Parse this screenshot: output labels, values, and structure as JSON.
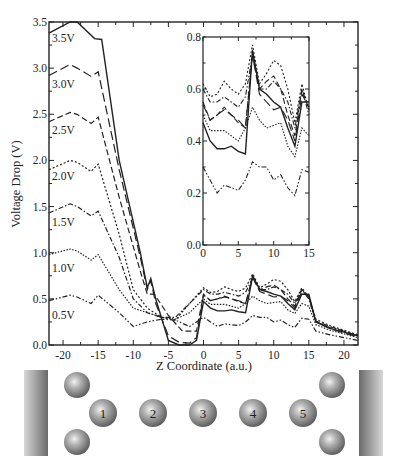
{
  "chart_data": {
    "type": "line",
    "title": "",
    "xlabel": "Z Coordinate (a.u.)",
    "ylabel": "Voltage Drop (V)",
    "xlim": [
      -22,
      22
    ],
    "ylim": [
      0,
      3.5
    ],
    "xticks": [
      -20,
      -15,
      -10,
      -5,
      0,
      5,
      10,
      15,
      20
    ],
    "yticks": [
      "0.0",
      "0.5",
      "1.0",
      "1.5",
      "2.0",
      "2.5",
      "3.0",
      "3.5"
    ],
    "grid": false,
    "legend": "inline labels at left edge",
    "series": [
      {
        "name": "3.5V",
        "style": "solid",
        "x": [
          -22,
          -19,
          -18,
          -15.5,
          -14.5,
          -12,
          -9,
          -8,
          -7.5,
          -6.8,
          -5,
          -3.5,
          -2,
          -1,
          0,
          1,
          2,
          3,
          4,
          5,
          6,
          7,
          8,
          9,
          10,
          11,
          12,
          13,
          14,
          15,
          16,
          18,
          20,
          22
        ],
        "y": [
          3.38,
          3.52,
          3.5,
          3.32,
          3.31,
          2.0,
          1.0,
          0.62,
          0.72,
          0.5,
          0.05,
          0.0,
          0.0,
          0.05,
          0.47,
          0.4,
          0.37,
          0.37,
          0.38,
          0.36,
          0.35,
          0.75,
          0.6,
          0.58,
          0.55,
          0.53,
          0.45,
          0.38,
          0.55,
          0.55,
          0.25,
          0.18,
          0.14,
          0.1
        ]
      },
      {
        "name": "3.0V",
        "style": "long-dash",
        "x": [
          -22,
          -19,
          -18,
          -16,
          -15,
          -12,
          -9,
          -8,
          -7.5,
          -6.8,
          -5,
          -3.5,
          -2,
          -1,
          0,
          1,
          2,
          3,
          4,
          5,
          6,
          7,
          8,
          9,
          10,
          11,
          12,
          13,
          14,
          15,
          16,
          18,
          20,
          22
        ],
        "y": [
          2.92,
          3.04,
          3.0,
          2.91,
          2.96,
          1.9,
          0.95,
          0.6,
          0.7,
          0.45,
          0.1,
          0.03,
          0.02,
          0.08,
          0.54,
          0.48,
          0.5,
          0.52,
          0.5,
          0.48,
          0.45,
          0.73,
          0.58,
          0.55,
          0.52,
          0.53,
          0.48,
          0.4,
          0.58,
          0.53,
          0.25,
          0.18,
          0.13,
          0.09
        ]
      },
      {
        "name": "2.5V",
        "style": "dash",
        "x": [
          -22,
          -19,
          -18,
          -16,
          -15,
          -12,
          -9,
          -8,
          -7,
          -5,
          -3,
          -1,
          0,
          1,
          2,
          3,
          4,
          5,
          6,
          7,
          8,
          9,
          10,
          11,
          12,
          13,
          14,
          15,
          16,
          18,
          20,
          22
        ],
        "y": [
          2.42,
          2.52,
          2.5,
          2.4,
          2.47,
          1.6,
          0.8,
          0.55,
          0.55,
          0.32,
          0.15,
          0.15,
          0.55,
          0.48,
          0.5,
          0.53,
          0.5,
          0.47,
          0.45,
          0.74,
          0.6,
          0.63,
          0.65,
          0.6,
          0.5,
          0.42,
          0.6,
          0.52,
          0.26,
          0.2,
          0.15,
          0.1
        ]
      },
      {
        "name": "2.0V",
        "style": "dotted",
        "x": [
          -22,
          -19,
          -18,
          -16,
          -15,
          -12,
          -10,
          -8,
          -6,
          -4,
          -2,
          0,
          1,
          2,
          3,
          4,
          5,
          6,
          7,
          8,
          9,
          10,
          11,
          12,
          13,
          14,
          15,
          16,
          18,
          20,
          22
        ],
        "y": [
          1.9,
          2.0,
          1.98,
          1.88,
          1.96,
          1.2,
          0.6,
          0.4,
          0.3,
          0.27,
          0.45,
          0.62,
          0.57,
          0.58,
          0.63,
          0.6,
          0.58,
          0.62,
          0.77,
          0.62,
          0.66,
          0.71,
          0.69,
          0.6,
          0.47,
          0.62,
          0.52,
          0.28,
          0.21,
          0.16,
          0.11
        ]
      },
      {
        "name": "1.5V",
        "style": "dash-dot",
        "x": [
          -22,
          -19,
          -18,
          -16,
          -15,
          -12,
          -10,
          -8,
          -6,
          -4,
          -2,
          0,
          1,
          2,
          3,
          4,
          5,
          6,
          7,
          8,
          9,
          10,
          11,
          12,
          13,
          14,
          15,
          16,
          18,
          20,
          22
        ],
        "y": [
          1.43,
          1.53,
          1.5,
          1.4,
          1.45,
          0.95,
          0.5,
          0.35,
          0.3,
          0.3,
          0.45,
          0.6,
          0.55,
          0.55,
          0.57,
          0.55,
          0.53,
          0.57,
          0.73,
          0.6,
          0.6,
          0.63,
          0.6,
          0.55,
          0.45,
          0.6,
          0.5,
          0.25,
          0.19,
          0.15,
          0.1
        ]
      },
      {
        "name": "1.0V",
        "style": "fine-dot",
        "x": [
          -22,
          -19,
          -18,
          -16,
          -15,
          -12,
          -10,
          -8,
          -6,
          -4,
          -2,
          0,
          1,
          2,
          3,
          4,
          5,
          6,
          7,
          8,
          9,
          10,
          11,
          12,
          13,
          14,
          15,
          16,
          18,
          20,
          22
        ],
        "y": [
          0.98,
          1.04,
          1.02,
          0.92,
          0.98,
          0.6,
          0.4,
          0.35,
          0.3,
          0.28,
          0.35,
          0.5,
          0.44,
          0.44,
          0.44,
          0.42,
          0.4,
          0.45,
          0.53,
          0.48,
          0.45,
          0.46,
          0.47,
          0.38,
          0.34,
          0.45,
          0.42,
          0.22,
          0.16,
          0.12,
          0.08
        ]
      },
      {
        "name": "0.5V",
        "style": "dash-dot-dot",
        "x": [
          -22,
          -19,
          -18,
          -16,
          -15,
          -12,
          -10,
          -8,
          -6,
          -4,
          -2,
          0,
          1,
          2,
          3,
          4,
          5,
          6,
          7,
          8,
          9,
          10,
          11,
          12,
          13,
          14,
          15,
          16,
          18,
          20,
          22
        ],
        "y": [
          0.48,
          0.54,
          0.52,
          0.45,
          0.54,
          0.35,
          0.2,
          0.25,
          0.28,
          0.27,
          0.2,
          0.3,
          0.25,
          0.2,
          0.23,
          0.22,
          0.21,
          0.25,
          0.32,
          0.3,
          0.3,
          0.25,
          0.27,
          0.22,
          0.19,
          0.29,
          0.28,
          0.15,
          0.11,
          0.08,
          0.05
        ]
      }
    ],
    "inset": {
      "xlim": [
        0,
        15
      ],
      "ylim": [
        0,
        0.8
      ],
      "xticks": [
        "0",
        "5",
        "10",
        "15"
      ],
      "yticks": [
        "0.0",
        "0.2",
        "0.4",
        "0.6",
        "0.8"
      ],
      "description": "Zoom of the 0–15 a.u. region showing the same 7 curves"
    }
  },
  "diagram": {
    "atom_labels": [
      "1",
      "2",
      "3",
      "4",
      "5"
    ],
    "electrodes": [
      "left-electrode",
      "right-electrode"
    ]
  }
}
